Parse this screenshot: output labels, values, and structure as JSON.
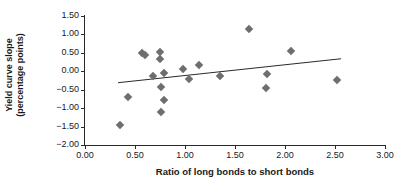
{
  "chart_data": {
    "type": "scatter",
    "title": "",
    "xlabel": "Ratio of long bonds to short bonds",
    "ylabel": "Yield curve slope (percentage points)",
    "ylabel_line1": "Yield curve slope",
    "ylabel_line2": "(percentage points)",
    "xlim": [
      0.0,
      3.0
    ],
    "ylim": [
      -2.0,
      1.5
    ],
    "xticks": [
      0.0,
      0.5,
      1.0,
      1.5,
      2.0,
      2.5,
      3.0
    ],
    "xticklabels": [
      "0.00",
      "0.50",
      "1.00",
      "1.50",
      "2.00",
      "2.50",
      "3.00"
    ],
    "yticks": [
      1.5,
      1.0,
      0.5,
      0.0,
      -0.5,
      -1.0,
      -1.5,
      -2.0
    ],
    "yticklabels": [
      "1.50",
      "1.00",
      "0.50",
      "0.00",
      "-0.50",
      "-1.00",
      "-1.50",
      "-2.00"
    ],
    "grid": false,
    "legend": null,
    "marker": "diamond",
    "marker_color": "#6e6e6e",
    "line_color": "#2a2a2a",
    "points": [
      {
        "x": 0.35,
        "y": -1.45
      },
      {
        "x": 0.43,
        "y": -0.71
      },
      {
        "x": 0.57,
        "y": 0.5
      },
      {
        "x": 0.6,
        "y": 0.43
      },
      {
        "x": 0.68,
        "y": -0.13
      },
      {
        "x": 0.75,
        "y": 0.53
      },
      {
        "x": 0.75,
        "y": 0.34
      },
      {
        "x": 0.76,
        "y": -0.42
      },
      {
        "x": 0.76,
        "y": -1.1
      },
      {
        "x": 0.79,
        "y": -0.05
      },
      {
        "x": 0.79,
        "y": -0.78
      },
      {
        "x": 0.98,
        "y": 0.06
      },
      {
        "x": 1.04,
        "y": -0.21
      },
      {
        "x": 1.14,
        "y": 0.16
      },
      {
        "x": 1.35,
        "y": -0.14
      },
      {
        "x": 1.64,
        "y": 1.15
      },
      {
        "x": 1.81,
        "y": -0.44
      },
      {
        "x": 1.82,
        "y": -0.07
      },
      {
        "x": 2.06,
        "y": 0.55
      },
      {
        "x": 2.52,
        "y": -0.24
      }
    ],
    "trendline": {
      "x_start": 0.33,
      "y_start": -0.31,
      "x_end": 2.56,
      "y_end": 0.34
    }
  }
}
